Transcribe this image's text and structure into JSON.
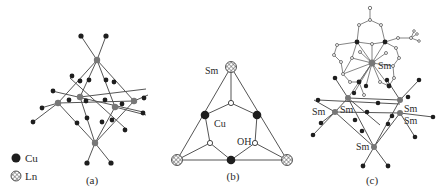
{
  "figure": {
    "panels": [
      {
        "id": "a",
        "label": "(a)"
      },
      {
        "id": "b",
        "label": "(b)"
      },
      {
        "id": "c",
        "label": "(c)"
      }
    ],
    "legend": {
      "items": [
        {
          "symbol": "filled-black-circle",
          "label": "Cu"
        },
        {
          "symbol": "crosshatched-circle",
          "label": "Ln"
        }
      ]
    },
    "panel_b_labels": {
      "sm": "Sm",
      "cu": "Cu",
      "oh": "OH"
    },
    "panel_c_labels": {
      "sm_center": "Sm",
      "sm_left_outer": "Sm",
      "sm_left_inner": "Sm",
      "sm_right_upper": "Sm",
      "sm_right_lower": "Sm",
      "sm_bottom": "Sm"
    },
    "colors": {
      "bond": "#555555",
      "cu": "#1e1e1e",
      "ln_node": "#777777",
      "background": "#ffffff"
    }
  }
}
